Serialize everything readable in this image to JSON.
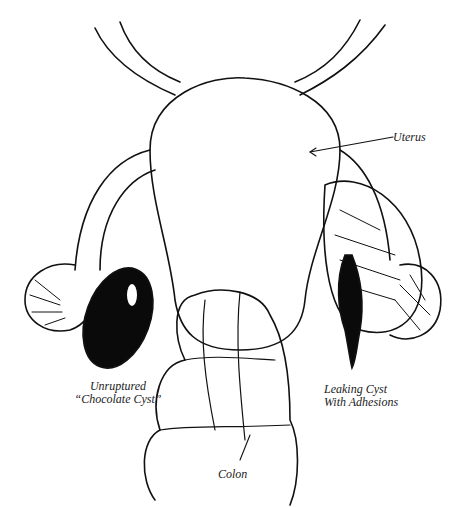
{
  "figure": {
    "type": "anatomical line illustration",
    "labels": {
      "uterus": "Uterus",
      "left_cyst_line1": "Unruptured",
      "left_cyst_line2": "“Chocolate Cyst”",
      "right_cyst_line1": "Leaking Cyst",
      "right_cyst_line2": "With Adhesions",
      "colon": "Colon"
    },
    "colors": {
      "ink": "#111111",
      "background": "#ffffff"
    }
  }
}
